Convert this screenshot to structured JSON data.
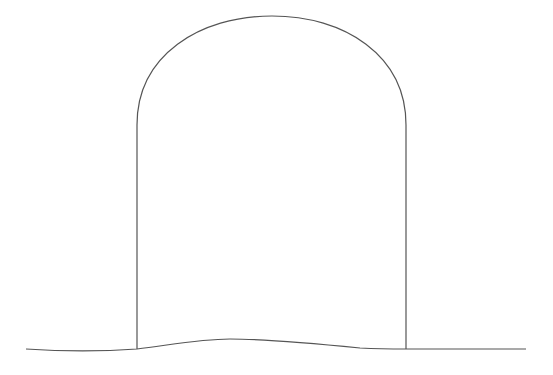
{
  "drawing": {
    "description": "Line drawing of an arch / tombstone outline on wavy ground",
    "stroke_color": "#555555",
    "background": "#ffffff",
    "arch": {
      "left_x": 137,
      "right_x": 406,
      "top_y": 16,
      "spring_y": 120,
      "base_left_y": 349,
      "base_right_y": 349
    },
    "ground": {
      "start": [
        26,
        349
      ],
      "peak": [
        230,
        339
      ],
      "end": [
        526,
        349
      ]
    }
  }
}
